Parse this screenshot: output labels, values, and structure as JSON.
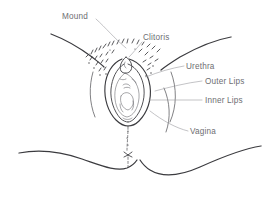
{
  "diagram": {
    "type": "line-illustration",
    "canvas": {
      "width": 280,
      "height": 207
    },
    "background_color": "#ffffff",
    "ink_color": "#3b3b3f",
    "label_color": "#6e6e72",
    "leader_color": "#9a9aa0"
  },
  "labels": [
    {
      "id": "mound",
      "text": "Mound",
      "x": 62,
      "y": 16,
      "anchor": "start",
      "leader": "M 96 18 C 104 26, 112 36, 124 47"
    },
    {
      "id": "clitoris",
      "text": "Clitoris",
      "x": 143,
      "y": 38,
      "anchor": "start",
      "leader": "M 142 41 C 136 47, 132 53, 128 58"
    },
    {
      "id": "urethra",
      "text": "Urethra",
      "x": 186,
      "y": 68,
      "anchor": "start",
      "leader": "M 184 66 C 172 68, 160 72, 148 76"
    },
    {
      "id": "outer-lips",
      "text": "Outer Lips",
      "x": 205,
      "y": 83,
      "anchor": "start",
      "leader": "M 203 81 C 188 83, 172 86, 156 90"
    },
    {
      "id": "inner-lips",
      "text": "Inner Lips",
      "x": 205,
      "y": 102,
      "anchor": "start",
      "leader": "M 203 100 C 186 100, 168 100, 150 100"
    },
    {
      "id": "vagina",
      "text": "Vagina",
      "x": 190,
      "y": 133,
      "anchor": "start",
      "leader": "M 188 131 C 176 128, 164 122, 150 112"
    }
  ],
  "icon_names": {
    "mound_leader": "leader-line-icon",
    "clitoris_leader": "leader-line-icon",
    "urethra_leader": "leader-line-icon",
    "outer_lips_leader": "leader-line-icon",
    "inner_lips_leader": "leader-line-icon",
    "vagina_leader": "leader-line-icon"
  },
  "strokes": {
    "thigh_left_upper": "M 52 35 C 70 42, 88 52, 100 62",
    "thigh_right_upper": "M 228 38 C 210 42, 190 52, 168 64",
    "thigh_left_lower": "M 20 152 C 44 150, 74 156, 104 168 C 118 173, 128 172, 136 166",
    "thigh_right_lower": "M 260 146 C 238 150, 212 160, 186 172 C 168 180, 152 176, 141 166",
    "groin_left": "M 94 70 C 90 84, 90 100, 96 116",
    "groin_right": "M 170 70 C 176 86, 176 104, 170 120",
    "perineum": "M 128 126 C 128 140, 127 152, 127 166"
  },
  "vulva": {
    "outer_lip_left": "M 120 60 C 108 66, 104 82, 106 96 C 108 110, 116 120, 126 124",
    "outer_lip_right": "M 130 60 C 144 65, 150 81, 149 96 C 148 110, 138 121, 128 124",
    "inner_lip_left": "M 123 64 C 114 70, 111 84, 113 96 C 115 108, 120 117, 126 120",
    "inner_lip_right": "M 128 64 C 138 69, 143 83, 142 96 C 141 108, 134 118, 127 120",
    "vestibule": "M 125 72 C 116 78, 114 90, 116 100 C 118 110, 122 115, 127 116 C 132 115, 137 109, 138 99 C 139 88, 134 77, 125 72",
    "clitoral_hood": "M 126 58 C 122 62, 121 67, 123 70 C 125 72, 128 72, 130 69 C 131 66, 130 61, 126 58",
    "urethral_opening": "M 124 86 C 126 84, 129 85, 130 87",
    "vaginal_opening": "M 121 96 C 124 92, 130 92, 133 97 C 135 102, 132 108, 127 109 C 122 108, 119 101, 121 96"
  }
}
